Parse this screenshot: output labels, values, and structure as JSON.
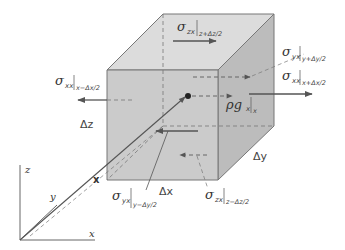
{
  "diagram": {
    "colors": {
      "face_front": "#c9c9c9",
      "face_top": "#dcdcdc",
      "face_side": "#b9b9b9",
      "edge": "#666666",
      "arrow": "#555555",
      "axis": "#555555",
      "text": "#333333"
    },
    "axes": {
      "z": "z",
      "y": "y",
      "x": "x",
      "position_vector": "x"
    },
    "dimensions": {
      "dz": "Δz",
      "dy": "Δy",
      "dx": "Δx"
    },
    "labels": {
      "szx_top": {
        "symbol": "σ",
        "sub": "zx",
        "eval": "z+Δz/2"
      },
      "syx_back": {
        "symbol": "σ",
        "sub": "yx",
        "eval": "y+Δy/2"
      },
      "sxx_right": {
        "symbol": "σ",
        "sub": "xx",
        "eval": "x+Δx/2"
      },
      "sxx_left": {
        "symbol": "σ",
        "sub": "xx",
        "eval": "x−Δx/2"
      },
      "body_force": {
        "symbol": "ρg",
        "sub": "x",
        "eval": "x"
      },
      "syx_front": {
        "symbol": "σ",
        "sub": "yx",
        "eval": "y−Δy/2"
      },
      "szx_bottom": {
        "symbol": "σ",
        "sub": "zx",
        "eval": "z−Δz/2"
      }
    }
  }
}
